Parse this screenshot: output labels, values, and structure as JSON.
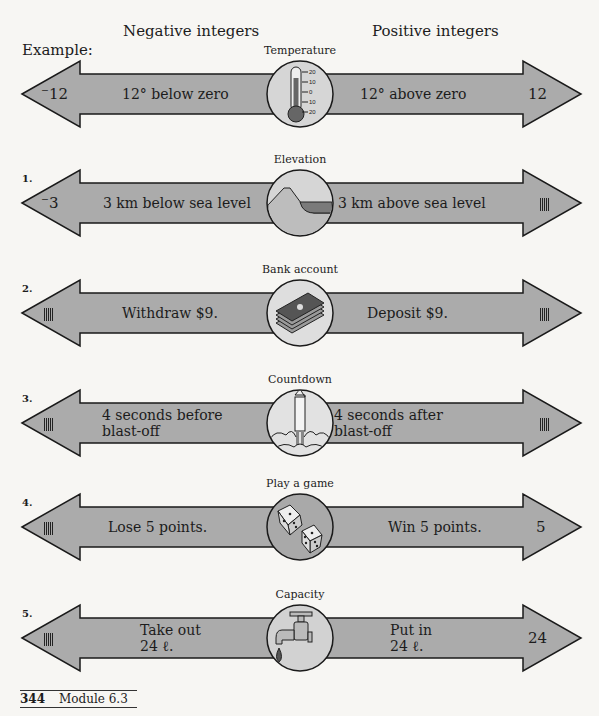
{
  "headers": {
    "negative": "Negative integers",
    "positive": "Positive integers",
    "example": "Example:"
  },
  "rows": [
    {
      "number": "",
      "caption": "Temperature",
      "icon": "thermometer-icon",
      "left_value": "⁻12",
      "left_text": [
        "12° below zero"
      ],
      "right_text": [
        "12° above zero"
      ],
      "right_value": "12",
      "circle_fill": "#d6d6d6"
    },
    {
      "number": "1.",
      "caption": "Elevation",
      "icon": "mountain-sea-icon",
      "left_value": "⁻3",
      "left_text": [
        "3 km below sea level"
      ],
      "right_text": [
        "3 km above sea level"
      ],
      "right_value": "tally",
      "circle_fill": "#d6d6d6"
    },
    {
      "number": "2.",
      "caption": "Bank account",
      "icon": "money-stack-icon",
      "left_value": "tally",
      "left_text": [
        "Withdraw $9."
      ],
      "right_text": [
        "Deposit $9."
      ],
      "right_value": "tally",
      "circle_fill": "#dedede"
    },
    {
      "number": "3.",
      "caption": "Countdown",
      "icon": "rocket-icon",
      "left_value": "tally",
      "left_text": [
        "4 seconds before",
        "blast-off"
      ],
      "right_text": [
        "4 seconds after",
        "blast-off"
      ],
      "right_value": "tally",
      "circle_fill": "#e2e2e2"
    },
    {
      "number": "4.",
      "caption": "Play a game",
      "icon": "dice-icon",
      "left_value": "tally",
      "left_text": [
        "Lose 5 points."
      ],
      "right_text": [
        "Win 5 points."
      ],
      "right_value": "5",
      "circle_fill": "#a9a9a9"
    },
    {
      "number": "5.",
      "caption": "Capacity",
      "icon": "faucet-icon",
      "left_value": "tally",
      "left_text": [
        "Take out",
        "24 ℓ."
      ],
      "right_text": [
        "Put in",
        "24 ℓ."
      ],
      "right_value": "24",
      "circle_fill": "#d2d2d2"
    }
  ],
  "footer": {
    "page": "344",
    "module": "Module 6.3"
  },
  "colors": {
    "arrow_fill": "#ababab",
    "arrow_stroke": "#1a1a1a",
    "background": "#f7f6f3"
  }
}
